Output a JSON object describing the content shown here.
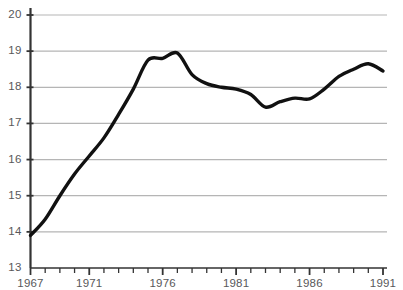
{
  "chart_data": {
    "type": "line",
    "title": "",
    "subtitle": "",
    "xlabel": "",
    "ylabel": "",
    "xlim": [
      1967,
      1991
    ],
    "ylim": [
      13,
      20
    ],
    "grid": "horizontal",
    "legend": "none",
    "annotations": [],
    "y_ticks": [
      13,
      14,
      15,
      16,
      17,
      18,
      19,
      20
    ],
    "y_tick_labels": [
      "13",
      "14",
      "15",
      "16",
      "17",
      "18",
      "19",
      "20"
    ],
    "x_ticks": [
      1967,
      1968,
      1969,
      1970,
      1971,
      1972,
      1973,
      1974,
      1975,
      1976,
      1977,
      1978,
      1979,
      1980,
      1981,
      1982,
      1983,
      1984,
      1985,
      1986,
      1987,
      1988,
      1989,
      1990,
      1991
    ],
    "x_tick_labels_shown": [
      "1967",
      "1971",
      "1976",
      "1981",
      "1986",
      "1991"
    ],
    "x_labelled_ticks": [
      1967,
      1971,
      1976,
      1981,
      1986,
      1991
    ],
    "series": [
      {
        "name": "series-1",
        "color": "#111111",
        "line_width": 3.4,
        "x": [
          1967,
          1968,
          1969,
          1970,
          1971,
          1972,
          1973,
          1974,
          1975,
          1976,
          1977,
          1978,
          1979,
          1980,
          1981,
          1982,
          1983,
          1984,
          1985,
          1986,
          1987,
          1988,
          1989,
          1990,
          1991
        ],
        "values": [
          13.9,
          14.35,
          15.0,
          15.6,
          16.1,
          16.6,
          17.25,
          17.95,
          18.75,
          18.8,
          18.95,
          18.35,
          18.1,
          18.0,
          17.95,
          17.8,
          17.45,
          17.6,
          17.7,
          17.68,
          17.95,
          18.3,
          18.5,
          18.65,
          18.45
        ]
      }
    ]
  },
  "axis_style": {
    "axis_color": "#333333",
    "gridline_color": "#b5b5b5",
    "tick_color": "#333333",
    "label_color": "#58585a",
    "background": "#ffffff"
  }
}
